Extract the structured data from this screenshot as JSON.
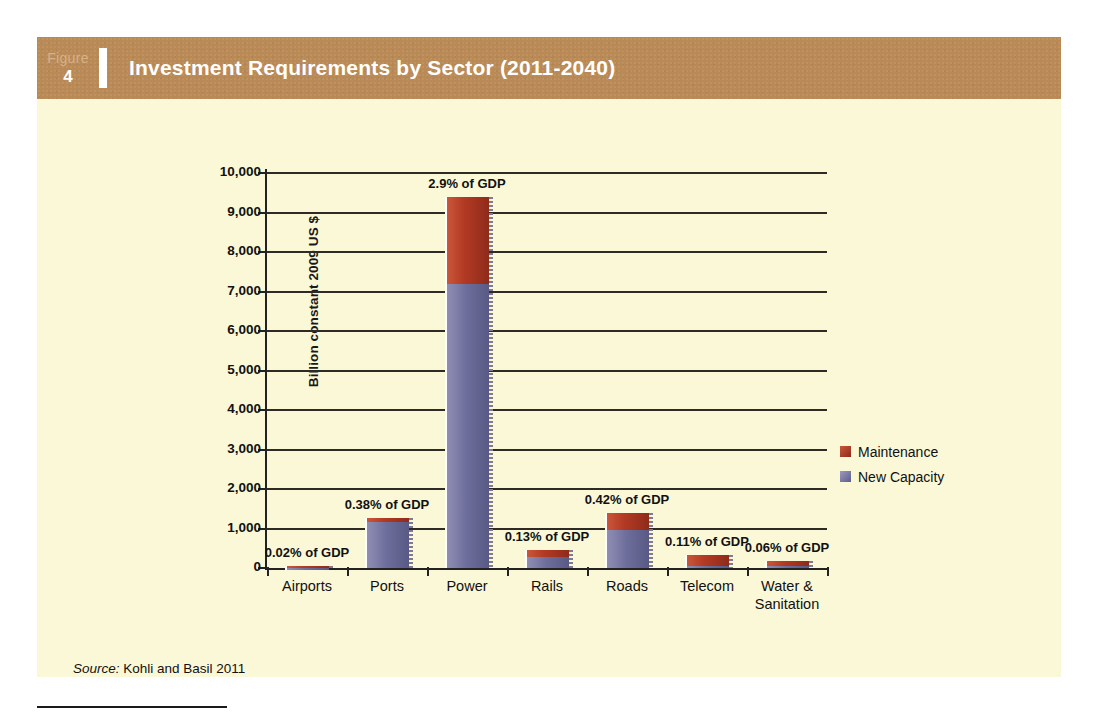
{
  "figure": {
    "label_word": "Figure",
    "number": "4",
    "title": "Investment Requirements by Sector (2011-2040)",
    "source_prefix": "Source:",
    "source_text": " Kohli and Basil 2011"
  },
  "colors": {
    "header_band": "#b98a55",
    "card_background": "#fbf8d8",
    "maintenance": "#b33a24",
    "new_capacity": "#6e6e9c",
    "axis": "#222222"
  },
  "chart_data": {
    "type": "bar",
    "subtype": "stacked",
    "title": "Investment Requirements by Sector (2011-2040)",
    "xlabel": "",
    "ylabel": "Billion constant 2009 US $",
    "ylim": [
      0,
      10000
    ],
    "ytick_step": 1000,
    "yticks": [
      "0",
      "1,000",
      "2,000",
      "3,000",
      "4,000",
      "5,000",
      "6,000",
      "7,000",
      "8,000",
      "9,000",
      "10,000"
    ],
    "grid": true,
    "legend_position": "right",
    "categories": [
      "Airports",
      "Ports",
      "Power",
      "Rails",
      "Roads",
      "Telecom",
      "Water & Sanitation"
    ],
    "series": [
      {
        "name": "New Capacity",
        "color": "#6e6e9c",
        "values": [
          45,
          1160,
          7200,
          290,
          960,
          60,
          40
        ]
      },
      {
        "name": "Maintenance",
        "color": "#b33a24",
        "values": [
          15,
          95,
          2200,
          165,
          440,
          270,
          135
        ]
      }
    ],
    "annotations": [
      {
        "category": "Airports",
        "text": "0.02% of GDP"
      },
      {
        "category": "Ports",
        "text": "0.38% of GDP"
      },
      {
        "category": "Power",
        "text": "2.9% of GDP"
      },
      {
        "category": "Rails",
        "text": "0.13% of GDP"
      },
      {
        "category": "Roads",
        "text": "0.42% of GDP"
      },
      {
        "category": "Telecom",
        "text": "0.11% of GDP"
      },
      {
        "category": "Water & Sanitation",
        "text": "0.06% of GDP"
      }
    ],
    "category_label_lines": [
      [
        "Airports"
      ],
      [
        "Ports"
      ],
      [
        "Power"
      ],
      [
        "Rails"
      ],
      [
        "Roads"
      ],
      [
        "Telecom"
      ],
      [
        "Water &",
        "Sanitation"
      ]
    ]
  },
  "legend": {
    "items": [
      {
        "label": "Maintenance",
        "swatch": "maint"
      },
      {
        "label": "New Capacity",
        "swatch": "newcap"
      }
    ]
  }
}
